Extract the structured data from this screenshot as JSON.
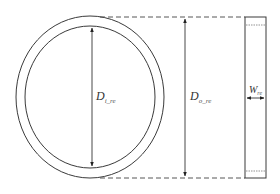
{
  "diagram": {
    "type": "geometry-schematic",
    "colors": {
      "stroke": "#3a3a3a",
      "dashed": "#444444",
      "dotted": "#777777",
      "text": "#333333",
      "background": "#ffffff"
    },
    "ring": {
      "center": [
        90,
        97
      ],
      "outer": {
        "rx": 74,
        "ry": 81
      },
      "inner": {
        "rx": 65,
        "ry": 71
      }
    },
    "labels": {
      "inner_diameter": {
        "main": "D",
        "sub": "i_re"
      },
      "outer_diameter": {
        "main": "D",
        "sub": "o_re"
      },
      "width": {
        "main": "W",
        "sub": "re"
      }
    },
    "side_view": {
      "x": 245,
      "y": 17,
      "width": 21,
      "height": 161
    }
  }
}
